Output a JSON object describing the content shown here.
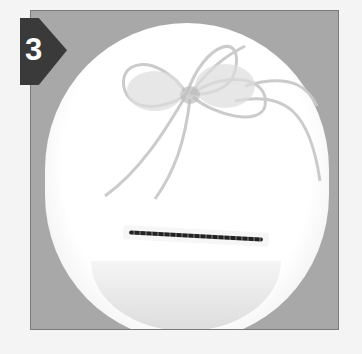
{
  "step": {
    "number": "3"
  },
  "photo": {
    "subject": "white round box lid with sheer ribbon bow and coin slot",
    "colors": {
      "background": "#a8a8a8",
      "box": "#ffffff",
      "badge": "#3a3a3a",
      "slot_stitch": "#222222"
    }
  }
}
